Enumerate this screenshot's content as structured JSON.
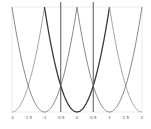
{
  "chart_data": {
    "type": "line",
    "title": "",
    "xlabel": "",
    "ylabel": "",
    "xlim": [
      -2,
      2
    ],
    "ylim": [
      0,
      1
    ],
    "grid": false,
    "legend": null,
    "xticks": [
      -2,
      -1.5,
      -1,
      -0.5,
      0,
      0.5,
      1,
      1.5,
      2
    ],
    "xtick_labels": [
      "-2",
      "-1.5",
      "-1",
      "-0.5",
      "0",
      "0.5",
      "1",
      "1.5",
      "2"
    ],
    "series": [
      {
        "name": "(x+2)^2",
        "center": -2,
        "color": "#8a8a8a",
        "width": 0.8
      },
      {
        "name": "(x+1)^2",
        "center": -1,
        "color": "#7a7a7a",
        "width": 0.9
      },
      {
        "name": "x^2",
        "center": 0,
        "color": "#3a3a3a",
        "width": 1.3
      },
      {
        "name": "(x-1)^2",
        "center": 1,
        "color": "#7a7a7a",
        "width": 0.9
      },
      {
        "name": "(x-2)^2",
        "center": 2,
        "color": "#8a8a8a",
        "width": 0.8
      }
    ],
    "vertical_lines": [
      {
        "x": -0.5,
        "color": "#555555"
      },
      {
        "x": 0.5,
        "color": "#555555"
      }
    ]
  }
}
